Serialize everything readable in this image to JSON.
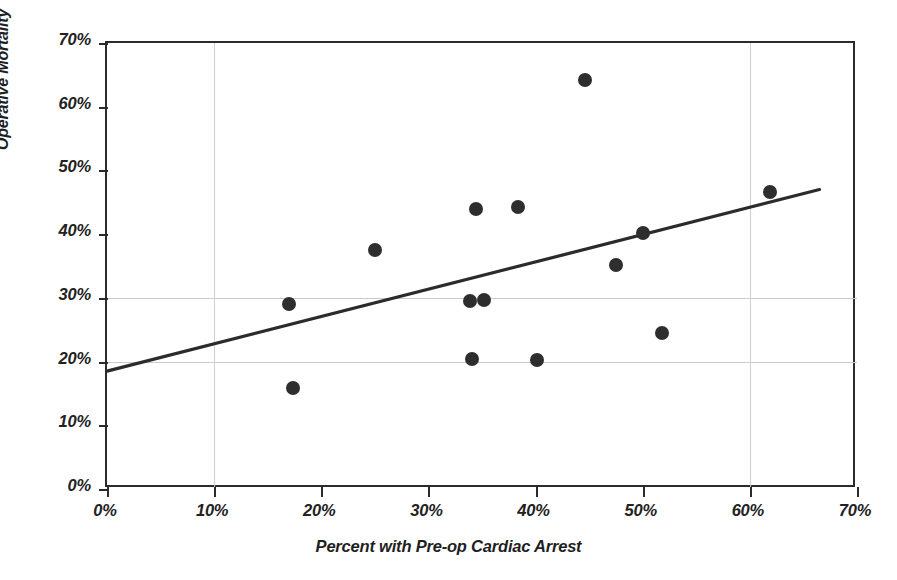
{
  "chart_data": {
    "type": "scatter",
    "title": "",
    "xlabel": "Percent with Pre-op Cardiac Arrest",
    "ylabel": "Operative Mortality",
    "xlim": [
      0,
      70
    ],
    "ylim": [
      0,
      70
    ],
    "xticks": [
      "0%",
      "10%",
      "20%",
      "30%",
      "40%",
      "50%",
      "60%",
      "70%"
    ],
    "xtick_values": [
      0,
      10,
      20,
      30,
      40,
      50,
      60,
      70
    ],
    "yticks": [
      "0%",
      "10%",
      "20%",
      "30%",
      "40%",
      "50%",
      "60%",
      "70%"
    ],
    "ytick_values": [
      0,
      10,
      20,
      30,
      40,
      50,
      60,
      70
    ],
    "grid": true,
    "gridlines_h": [
      20,
      30
    ],
    "gridlines_v": [
      10,
      60
    ],
    "legend": "none",
    "marker_color": "#2e2e2e",
    "line_color": "#2b2b2b",
    "axis_color": "#2b2b2b",
    "grid_color": "#c9c9c9",
    "points": [
      {
        "x": 17.0,
        "y": 29.0
      },
      {
        "x": 17.4,
        "y": 15.8
      },
      {
        "x": 25.0,
        "y": 37.5
      },
      {
        "x": 33.9,
        "y": 29.5
      },
      {
        "x": 34.1,
        "y": 20.4
      },
      {
        "x": 34.4,
        "y": 44.0
      },
      {
        "x": 35.2,
        "y": 29.7
      },
      {
        "x": 38.4,
        "y": 44.3
      },
      {
        "x": 40.1,
        "y": 20.3
      },
      {
        "x": 44.6,
        "y": 64.2
      },
      {
        "x": 47.5,
        "y": 35.2
      },
      {
        "x": 50.0,
        "y": 40.2
      },
      {
        "x": 51.8,
        "y": 24.5
      },
      {
        "x": 61.9,
        "y": 46.6
      }
    ],
    "trendline": {
      "type": "linear",
      "x_start": 0.0,
      "y_start": 18.5,
      "x_end": 66.5,
      "y_end": 47.0
    }
  }
}
